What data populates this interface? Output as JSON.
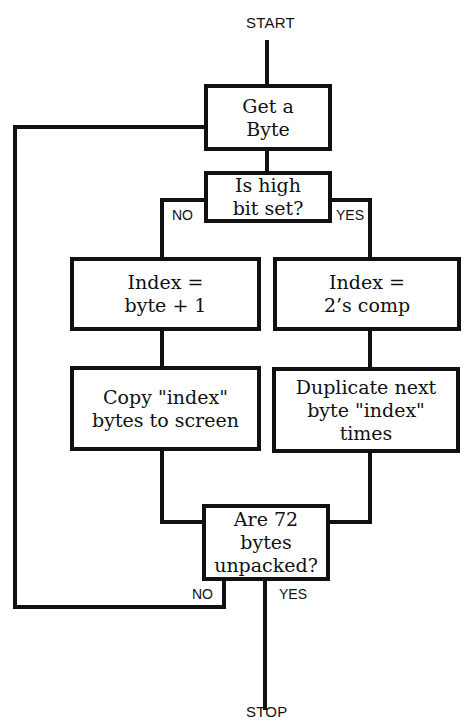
{
  "flowchart": {
    "start_label": "START",
    "stop_label": "STOP",
    "nodes": {
      "get_byte": {
        "lines": [
          "Get a",
          "Byte"
        ],
        "type": "process"
      },
      "high_bit": {
        "lines": [
          "Is high",
          "bit set?"
        ],
        "type": "decision"
      },
      "index_plus_one": {
        "lines": [
          "Index =",
          "byte + 1"
        ],
        "type": "process"
      },
      "index_twos_comp": {
        "lines": [
          "Index =",
          "2’s comp"
        ],
        "type": "process"
      },
      "copy_bytes": {
        "lines": [
          "Copy \"index\"",
          "bytes to screen"
        ],
        "type": "process"
      },
      "duplicate_byte": {
        "lines": [
          "Duplicate next",
          "byte \"index\"",
          "times"
        ],
        "type": "process"
      },
      "bytes_unpacked": {
        "lines": [
          "Are 72",
          "bytes",
          "unpacked?"
        ],
        "type": "decision"
      }
    },
    "branch_labels": {
      "high_bit_no": "NO",
      "high_bit_yes": "YES",
      "unpacked_no": "NO",
      "unpacked_yes": "YES"
    },
    "edges": [
      {
        "from": "START",
        "to": "get_byte"
      },
      {
        "from": "get_byte",
        "to": "high_bit"
      },
      {
        "from": "high_bit",
        "to": "index_plus_one",
        "label": "NO"
      },
      {
        "from": "high_bit",
        "to": "index_twos_comp",
        "label": "YES"
      },
      {
        "from": "index_plus_one",
        "to": "copy_bytes"
      },
      {
        "from": "index_twos_comp",
        "to": "duplicate_byte"
      },
      {
        "from": "copy_bytes",
        "to": "bytes_unpacked"
      },
      {
        "from": "duplicate_byte",
        "to": "bytes_unpacked"
      },
      {
        "from": "bytes_unpacked",
        "to": "get_byte",
        "label": "NO"
      },
      {
        "from": "bytes_unpacked",
        "to": "STOP",
        "label": "YES"
      }
    ]
  }
}
